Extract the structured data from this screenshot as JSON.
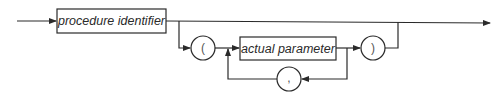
{
  "diagram": {
    "type": "syntax-railroad",
    "nodes": {
      "procedure_identifier": "procedure identifier",
      "open_paren": "(",
      "actual_parameter": "actual parameter",
      "comma": ",",
      "close_paren": ")"
    },
    "colors": {
      "stroke": "#2a2a2a",
      "background": "#ffffff"
    }
  }
}
